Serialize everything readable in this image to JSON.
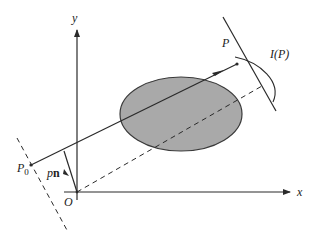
{
  "diagram": {
    "type": "projection-geometry",
    "labels": {
      "y_axis": "y",
      "x_axis": "x",
      "origin": "O",
      "point_p": "P",
      "point_p0": "P",
      "point_p0_sub": "0",
      "projection": "I(P)",
      "normal_p": "p",
      "normal_n": "n"
    },
    "colors": {
      "line": "#2a2a2a",
      "ellipse_fill": "#a9a9a9",
      "ellipse_stroke": "#3a3a3a",
      "background": "#ffffff"
    },
    "elements": [
      "x-axis",
      "y-axis",
      "ellipse-object",
      "ray-p0-to-p",
      "dashed-line-through-p0",
      "detector-line",
      "dashed-ray-from-origin",
      "normal-vector-pn",
      "projection-profile-arc"
    ]
  }
}
